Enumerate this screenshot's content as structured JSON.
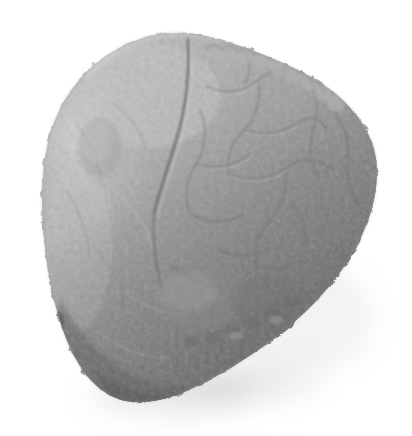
{
  "image": {
    "domain": "Natural-Image",
    "subject": "stone",
    "description": "Grayscale photograph of a rough, roughly triangular water-worn stone specimen isolated on a plain white background",
    "alt_text": "Grey stone fragment photographed from above on a white background",
    "orientation": "upright",
    "palette": {
      "background": "#ffffff",
      "highlight": "#cfcfcf",
      "light": "#bdbdbd",
      "midtone": "#9e9e9e",
      "mid_dark": "#8a8a8a",
      "shade": "#6f6f6f",
      "dark": "#585858",
      "deep_shadow": "#4a4a4a",
      "cast_shadow": "#e4e4e4",
      "crack_line": "#7a7a7a",
      "outline": "#8d8d8d"
    },
    "lighting": {
      "key_light_direction": "upper-left",
      "shadow_direction": "lower-right",
      "cast_shadow_opacity": 0.18
    },
    "subject_bounds": {
      "left": 42,
      "top": 33,
      "right": 378,
      "bottom": 404
    },
    "features": [
      {
        "name": "scalloped-top-right-edge",
        "note": "row of rounded bumps along the upper right rim"
      },
      {
        "name": "central-vertical-seam",
        "note": "dark fissure running from the top edge down the middle"
      },
      {
        "name": "reticulated-crack-network",
        "note": "web of fine cracks over the right lobe"
      },
      {
        "name": "lit-left-flank",
        "note": "pale, grainy left face catching the key light"
      },
      {
        "name": "dark-lower-rim",
        "note": "deeply shaded lower and lower-right margin"
      },
      {
        "name": "soft-cast-shadow",
        "note": "faint diffuse shadow under the lower right of the stone"
      }
    ],
    "silhouette_path": "M 150 36 C 171 31 196 33 219 40 C 243 46 262 54 283 63 C 303 72 321 82 337 95 C 352 108 365 124 372 143 C 379 163 378 186 372 208 C 365 233 352 257 335 279 C 317 302 296 322 272 340 C 248 358 222 374 195 387 C 172 398 148 405 126 401 C 107 397 93 385 82 369 C 70 351 62 330 56 307 C 49 281 45 253 43 225 C 41 197 42 169 48 143 C 54 117 66 94 84 75 C 101 57 124 43 150 36 Z"
  },
  "viewer": {
    "title": "stone",
    "width": 412,
    "height": 436
  }
}
